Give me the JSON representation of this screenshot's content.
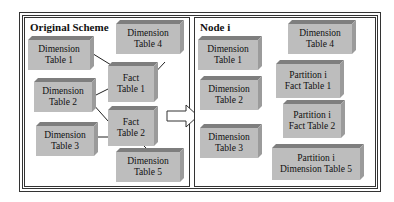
{
  "left_panel": {
    "title": "Original Scheme",
    "boxes": {
      "dim1": {
        "line1": "Dimension",
        "line2": "Table 1"
      },
      "dim4": {
        "line1": "Dimension",
        "line2": "Table 4"
      },
      "fact1": {
        "line1": "Fact",
        "line2": "Table 1"
      },
      "dim2": {
        "line1": "Dimension",
        "line2": "Table 2"
      },
      "fact2": {
        "line1": "Fact",
        "line2": "Table 2"
      },
      "dim3": {
        "line1": "Dimension",
        "line2": "Table 3"
      },
      "dim5": {
        "line1": "Dimension",
        "line2": "Table 5"
      }
    }
  },
  "right_panel": {
    "title": "Node i",
    "boxes": {
      "dim1": {
        "line1": "Dimension",
        "line2": "Table 1"
      },
      "dim4": {
        "line1": "Dimension",
        "line2": "Table 4"
      },
      "fact1": {
        "line1": "Partition i",
        "line2": "Fact Table 1"
      },
      "dim2": {
        "line1": "Dimension",
        "line2": "Table 2"
      },
      "fact2": {
        "line1": "Partition i",
        "line2": "Fact Table 2"
      },
      "dim3": {
        "line1": "Dimension",
        "line2": "Table 3"
      },
      "dim5": {
        "line1": "Partition i",
        "line2": "Dimension Table 5"
      }
    }
  },
  "colors": {
    "box_face": "#bdbdbd",
    "box_top": "#7e7e7e",
    "box_side": "#9b9b9b",
    "border": "#333333"
  }
}
